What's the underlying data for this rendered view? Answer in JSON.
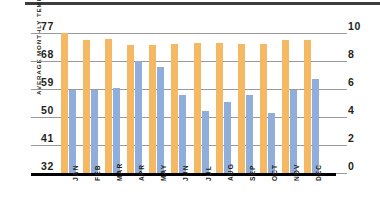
{
  "figure": {
    "top_rule_color": "#3d3d3d",
    "background": "#ffffff"
  },
  "axes": {
    "left_title": "AVERAGE MONTHLY TEMPERATURE (°F)",
    "left_ticks": [
      "77",
      "68",
      "59",
      "50",
      "41",
      "32"
    ],
    "right_ticks": [
      "10",
      "8",
      "6",
      "4",
      "2",
      "0"
    ]
  },
  "legend_colors": {
    "temperature": "#f6b963",
    "precipitation": "#90aedc"
  },
  "chart_data": {
    "type": "bar",
    "title": "",
    "subtitle": "",
    "xlabel": "",
    "ylabel": "AVERAGE MONTHLY TEMPERATURE (°F)",
    "y2label": "",
    "categories": [
      "JAN",
      "FEB",
      "MAR",
      "APR",
      "MAY",
      "JUN",
      "JUL",
      "AUG",
      "SEP",
      "OCT",
      "NOV",
      "DEC"
    ],
    "grid": true,
    "legend_position": "none",
    "axes": {
      "left": {
        "label": "AVERAGE MONTHLY TEMPERATURE (°F)",
        "ticks": [
          32,
          41,
          50,
          59,
          68,
          77
        ],
        "ylim": [
          32,
          77
        ]
      },
      "right": {
        "label": "",
        "ticks": [
          0,
          2,
          4,
          6,
          8,
          10
        ],
        "ylim": [
          0,
          10
        ]
      }
    },
    "series": [
      {
        "name": "Average monthly temperature (°F)",
        "axis": "left",
        "color": "#f6b963",
        "values": [
          77.0,
          74.8,
          75.0,
          73.2,
          73.2,
          73.6,
          73.8,
          73.8,
          73.6,
          73.6,
          74.8,
          74.8
        ]
      },
      {
        "name": "Average monthly precipitation (in)",
        "axis": "right",
        "color": "#90aedc",
        "values": [
          5.9,
          5.9,
          6.1,
          8.0,
          7.6,
          5.6,
          4.4,
          5.1,
          5.6,
          4.3,
          5.9,
          6.7
        ]
      }
    ]
  }
}
